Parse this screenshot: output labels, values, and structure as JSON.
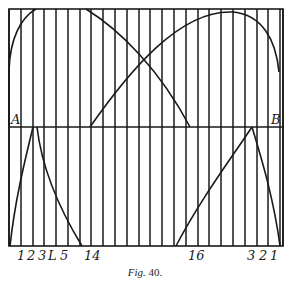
{
  "figure": {
    "caption_prefix": "Fig.",
    "caption_number": "40.",
    "line_color": "#1a1a1a",
    "background": "#ffffff",
    "frame": {
      "left": 9,
      "right": 283,
      "top": 9,
      "bottom": 246
    },
    "baseline_ab": {
      "y": 127,
      "label_left": "A",
      "label_right": "B"
    },
    "vertical_lines_x": [
      9,
      21,
      33,
      44,
      56,
      68,
      80,
      91,
      103,
      115,
      127,
      139,
      150,
      162,
      174,
      186,
      198,
      209,
      221,
      233,
      245,
      257,
      268,
      280,
      283
    ],
    "bottom_labels": [
      {
        "text": "1",
        "x": 17
      },
      {
        "text": "2",
        "x": 27
      },
      {
        "text": "3",
        "x": 38
      },
      {
        "text": "L",
        "x": 48
      },
      {
        "text": "5",
        "x": 60
      },
      {
        "text": "14",
        "x": 84
      },
      {
        "text": "16",
        "x": 188
      },
      {
        "text": "3",
        "x": 247
      },
      {
        "text": "2",
        "x": 259
      },
      {
        "text": "1",
        "x": 270
      }
    ],
    "curves": {
      "upper_left_arc": "M9,127 L9,70 C10,40 20,18 36,9",
      "upper_left_descending": "M86,9 C120,30 160,70 190,127",
      "upper_right_arc": "M90,127 C130,70 180,10 232,12 C262,14 276,40 279,72",
      "lower_left_rise": "M10,246 C15,200 25,160 33,127",
      "lower_left_fall": "M37,127 C42,170 60,210 82,246",
      "lower_right_rise": "M176,246 C200,200 230,160 252,127",
      "lower_right_fall": "M252,127 C262,160 274,200 280,246"
    }
  }
}
